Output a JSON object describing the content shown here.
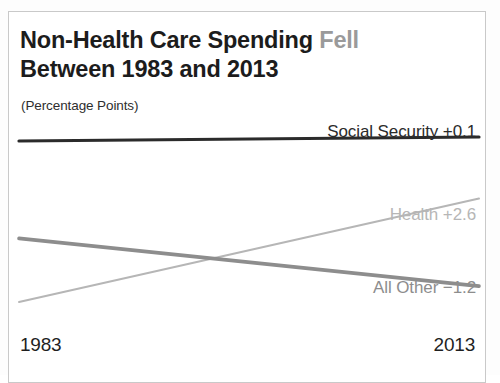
{
  "card": {
    "title": {
      "line1_main": "Non-Health Care Spending",
      "line1_accent": "Fell",
      "line2": "Between 1983 and 2013",
      "subtitle": "(Percentage Points)"
    }
  },
  "chart_data": {
    "type": "line",
    "subtitle": "(Percentage Points)",
    "xlabel": "",
    "ylabel": "",
    "grid": false,
    "legend": "inline-right-labels",
    "x": [
      1983,
      2013
    ],
    "x_tick_labels": [
      "1983",
      "2013"
    ],
    "series": [
      {
        "name": "Social Security",
        "label": "Social Security +0.1",
        "change": 0.1,
        "change_text": "+0.1",
        "color": "#2b2b2b",
        "width": 3.2,
        "values": [
          5.85,
          5.95
        ]
      },
      {
        "name": "All Other",
        "label": "All Other −1.2",
        "change": -1.2,
        "change_text": "−1.2",
        "color": "#8d8d8d",
        "width": 3.6,
        "values": [
          3.4,
          2.2
        ]
      },
      {
        "name": "Health",
        "label": "Health +2.6",
        "change": 2.6,
        "change_text": "+2.6",
        "color": "#b6b6b6",
        "width": 2.0,
        "values": [
          1.8,
          4.4
        ]
      }
    ]
  },
  "axis": {
    "start_year": "1983",
    "end_year": "2013"
  }
}
